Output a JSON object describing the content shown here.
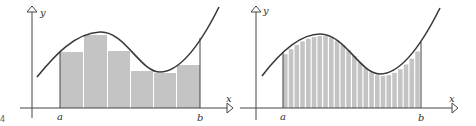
{
  "figure": {
    "page_fragment": "4",
    "colors": {
      "curve": "#3a3a3a",
      "axis": "#444444",
      "fill": "#c4c4c4",
      "strip_gap": "#ffffff"
    },
    "left_panel": {
      "y_label": "y",
      "x_label": "x",
      "a_label": "a",
      "b_label": "b",
      "rectangle_count": 6
    },
    "right_panel": {
      "y_label": "y",
      "x_label": "x",
      "a_label": "a",
      "b_label": "b",
      "rectangle_count": 24
    }
  },
  "chart_data": [
    {
      "type": "area",
      "title": "Riemann sum approximation (n = 6)",
      "xlabel": "x",
      "ylabel": "y",
      "annotations": [
        "a",
        "b"
      ],
      "series": [
        {
          "name": "rectangle heights (relative)",
          "values": [
            0.7,
            0.92,
            0.72,
            0.46,
            0.44,
            0.55
          ]
        }
      ]
    },
    {
      "type": "area",
      "title": "Riemann sum approximation (n = 24)",
      "xlabel": "x",
      "ylabel": "y",
      "annotations": [
        "a",
        "b"
      ],
      "series": [
        {
          "name": "rectangle count",
          "values": [
            24
          ]
        }
      ]
    }
  ]
}
